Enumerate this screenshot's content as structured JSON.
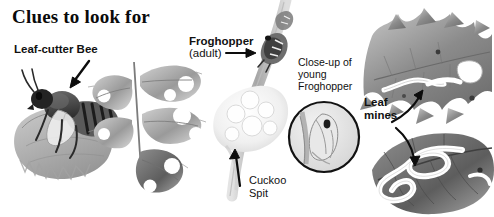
{
  "plate": {
    "title": "Clues to look for",
    "medium_note": "grayscale pencil illustration"
  },
  "labels": {
    "leaf_cutter_bee": "Leaf-cutter Bee",
    "froghopper": "Froghopper",
    "froghopper_adult": "(adult)",
    "closeup_line1": "Close-up of",
    "closeup_line2": "young",
    "closeup_line3": "Froghopper",
    "leaf_line1": "Leaf",
    "leaf_line2": "mines",
    "cuckoo_line1": "Cuckoo",
    "cuckoo_line2": "Spit"
  },
  "icons": {
    "bee_arrow": "arrow-down-left-icon",
    "froghopper_arrow": "arrow-right-icon",
    "cuckoo_arrow": "arrow-up-icon",
    "mine_arrow_upper": "curved-arrow-up-right-icon",
    "mine_arrow_lower": "curved-arrow-down-icon"
  },
  "illustrations": {
    "bee": "leaf-cutter-bee-carrying-leaf-piece",
    "rose_sprig": "rose-leaf-sprig-with-semicircular-notches",
    "stem": "plant-stem-with-adult-froghopper",
    "foam": "cuckoo-spit-foam-mass",
    "inset": "circular-inset-young-froghopper-nymph",
    "holly": "holly-leaf-with-mine-tracks",
    "mined_leaf": "leaf-with-white-winding-mines"
  },
  "colors": {
    "ink": "#111111",
    "paper": "#ffffff",
    "pencil_dark": "#4a4a4a",
    "pencil_mid": "#8a8a8a",
    "pencil_light": "#c9c9c9"
  }
}
